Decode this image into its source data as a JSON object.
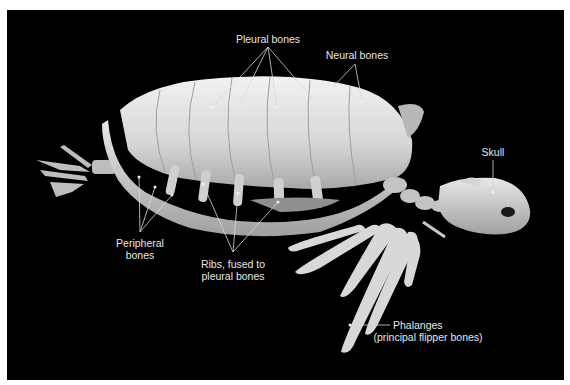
{
  "figure": {
    "background": "#000000",
    "labels": {
      "pleural": {
        "text": "Pleural bones"
      },
      "neural": {
        "text": "Neural bones"
      },
      "skull": {
        "text": "Skull"
      },
      "peripheral": {
        "line1": "Peripheral",
        "line2": "bones"
      },
      "ribs": {
        "line1": "Ribs, fused to",
        "line2": "pleural bones"
      },
      "phalanges": {
        "line1": "Phalanges",
        "line2": "(principal flipper bones)"
      }
    },
    "label_color": "#e6e6e6",
    "leader_line_color": "#d8d8d8"
  },
  "caption": {
    "text": ""
  }
}
